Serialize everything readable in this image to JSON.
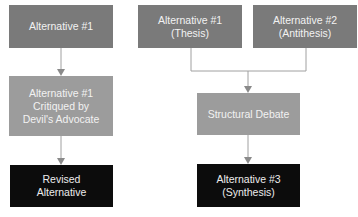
{
  "left_flow": {
    "box1": "Alternative #1",
    "box2": "Alternative #1\nCritiqued by\nDevil's Advocate",
    "box3": "Revised\nAlternative"
  },
  "right_flow": {
    "thesis": "Alternative #1\n(Thesis)",
    "antithesis": "Alternative #2\n(Antithesis)",
    "debate": "Structural Debate",
    "synthesis": "Alternative #3\n(Synthesis)"
  },
  "colors": {
    "input_box": "#7a7a7a",
    "process_box": "#9c9c9c",
    "output_box": "#0c0c0c",
    "connector": "#9a9a9a"
  }
}
